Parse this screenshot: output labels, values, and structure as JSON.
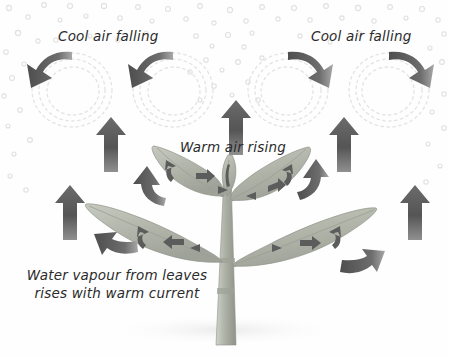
{
  "diagram": {
    "background_color": "#fefefe",
    "labels": {
      "cool_air_left": "Cool air falling",
      "cool_air_right": "Cool air falling",
      "warm_air": "Warm air rising",
      "water_vapour_line1": "Water vapour from leaves",
      "water_vapour_line2": "rises with warm current"
    },
    "colors": {
      "arrow_dark": "#5a5a5a",
      "arrow_darker": "#4a4a4a",
      "leaf_fill": "#b9bcb0",
      "leaf_edge": "#8f938a",
      "stem": "#b4b7ad",
      "vapour_dot": "#e2e2e2",
      "swirl": "#e6e6e6",
      "text": "#2b2b2b"
    },
    "elements": {
      "convection_loops": [
        {
          "name": "convection-loop-1",
          "cx": 72,
          "cy": 88,
          "rx": 40,
          "ry": 36,
          "arrow_direction": "down-left"
        },
        {
          "name": "convection-loop-2",
          "cx": 172,
          "cy": 88,
          "rx": 40,
          "ry": 36,
          "arrow_direction": "down-left"
        },
        {
          "name": "convection-loop-3",
          "cx": 290,
          "cy": 88,
          "rx": 40,
          "ry": 36,
          "arrow_direction": "down-right"
        },
        {
          "name": "convection-loop-4",
          "cx": 390,
          "cy": 88,
          "rx": 40,
          "ry": 36,
          "arrow_direction": "down-right"
        }
      ],
      "up_arrows": [
        {
          "name": "up-arrow-far-left",
          "x": 60,
          "y": 185,
          "h": 55
        },
        {
          "name": "up-arrow-left",
          "x": 108,
          "y": 118,
          "h": 55
        },
        {
          "name": "up-arrow-center",
          "x": 233,
          "y": 100,
          "h": 55
        },
        {
          "name": "up-arrow-right",
          "x": 348,
          "y": 118,
          "h": 55
        },
        {
          "name": "up-arrow-far-right",
          "x": 412,
          "y": 185,
          "h": 55
        }
      ],
      "leaves": [
        {
          "name": "leaf-upper-left",
          "inner_arrows": 2
        },
        {
          "name": "leaf-upper-right",
          "inner_arrows": 2
        },
        {
          "name": "leaf-lower-left",
          "inner_arrows": 2
        },
        {
          "name": "leaf-lower-right",
          "inner_arrows": 2
        },
        {
          "name": "leaf-bud-center",
          "inner_arrows": 1
        }
      ],
      "escape_arrows": [
        {
          "name": "escape-arrow-upper-left",
          "direction": "up-left"
        },
        {
          "name": "escape-arrow-lower-left",
          "direction": "left"
        },
        {
          "name": "escape-arrow-upper-right",
          "direction": "up-right"
        },
        {
          "name": "escape-arrow-lower-right",
          "direction": "right"
        }
      ],
      "vapour_dot_count": 120
    }
  }
}
